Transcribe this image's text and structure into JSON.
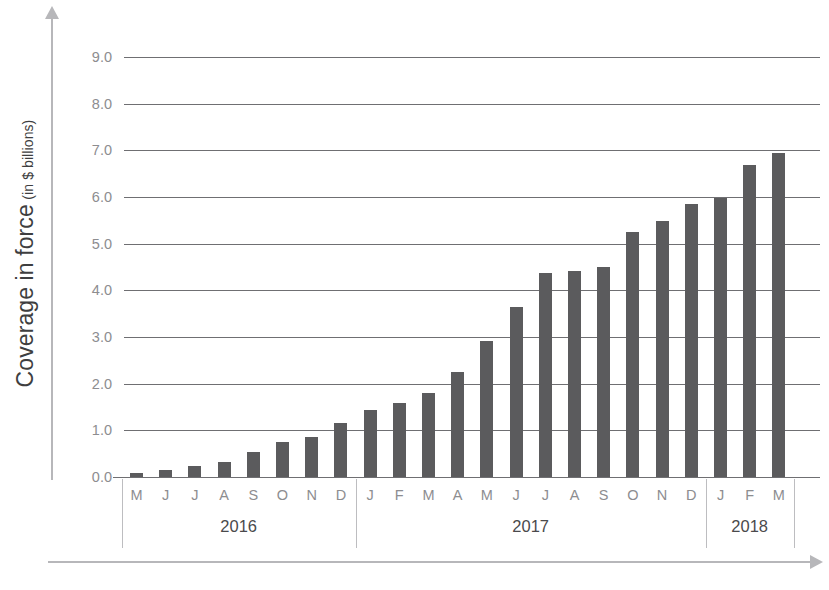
{
  "chart_data": {
    "type": "bar",
    "title": "",
    "ylabel": "Coverage in force",
    "ylabel_unit": "(in $ billions)",
    "xlabel": "",
    "ylim": [
      0,
      9
    ],
    "ytick_labels": [
      "0.0",
      "1.0",
      "2.0",
      "3.0",
      "4.0",
      "5.0",
      "6.0",
      "7.0",
      "8.0",
      "9.0"
    ],
    "ytick_values": [
      0,
      1,
      2,
      3,
      4,
      5,
      6,
      7,
      8,
      9
    ],
    "grid": "horizontal",
    "legend": "none",
    "bar_color": "#5b5b5d",
    "categories": [
      "M",
      "J",
      "J",
      "A",
      "S",
      "O",
      "N",
      "D",
      "J",
      "F",
      "M",
      "A",
      "M",
      "J",
      "J",
      "A",
      "S",
      "O",
      "N",
      "D",
      "J",
      "F",
      "M"
    ],
    "values": [
      0.08,
      0.15,
      0.24,
      0.32,
      0.53,
      0.74,
      0.86,
      1.16,
      1.44,
      1.58,
      1.81,
      2.25,
      2.91,
      3.65,
      4.37,
      4.41,
      4.49,
      5.25,
      5.49,
      5.85,
      5.97,
      6.68,
      6.95
    ],
    "groups": [
      {
        "label": "2016",
        "start_index": 0,
        "count": 8
      },
      {
        "label": "2017",
        "start_index": 8,
        "count": 12
      },
      {
        "label": "2018",
        "start_index": 20,
        "count": 3
      }
    ]
  }
}
